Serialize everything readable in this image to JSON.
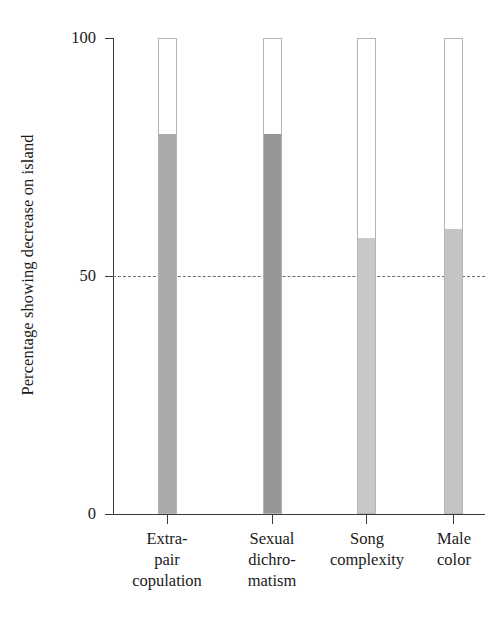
{
  "chart_data": {
    "type": "bar",
    "title": "",
    "subtitle": "",
    "xlabel": "",
    "ylabel": "Percentage showing decrease on island",
    "ylim": [
      0,
      100
    ],
    "yticks": [
      0,
      50,
      100
    ],
    "ytick_labels": [
      "0",
      "50",
      "100"
    ],
    "grid": false,
    "legend": null,
    "reference_line": {
      "value": 50,
      "style": "dashed",
      "color": "#6e6e6e"
    },
    "note": "Each bar is drawn as an outlined 100% frame with a shaded portion from 0 up to the value.",
    "categories": [
      "Extra-pair copulation",
      "Sexual dichromatism",
      "Song complexity",
      "Male color"
    ],
    "category_lines": [
      [
        "Extra-",
        "pair",
        "copulation"
      ],
      [
        "Sexual",
        "dichro-",
        "matism"
      ],
      [
        "Song",
        "complexity"
      ],
      [
        "Male",
        "color"
      ]
    ],
    "values": [
      80,
      80,
      58,
      60
    ],
    "bar_colors": [
      "#a9a9a9",
      "#969696",
      "#c8c8c8",
      "#c4c4c4"
    ],
    "bar_outline_color": "#b4b4b4",
    "frame_value": 100
  },
  "axis": {
    "y_title": "Percentage showing decrease on island",
    "tick_100": "100",
    "tick_50": "50",
    "tick_0": "0"
  },
  "labels": {
    "cat0_line0": "Extra-",
    "cat0_line1": "pair",
    "cat0_line2": "copulation",
    "cat1_line0": "Sexual",
    "cat1_line1": "dichro-",
    "cat1_line2": "matism",
    "cat2_line0": "Song",
    "cat2_line1": "complexity",
    "cat3_line0": "Male",
    "cat3_line1": "color"
  }
}
